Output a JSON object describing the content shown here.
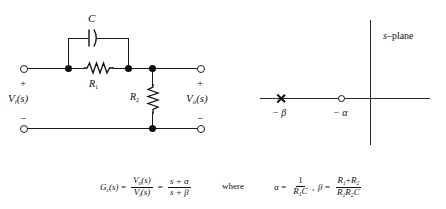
{
  "figure": {
    "circuit": {
      "title_components": {
        "capacitor_label": "C",
        "resistor1_label": "R",
        "resistor1_sub": "1",
        "resistor2_label": "R",
        "resistor2_sub": "2"
      },
      "input_port": {
        "plus": "+",
        "minus": "−",
        "label_main": "V",
        "label_sub": "i",
        "label_arg": "(s)"
      },
      "output_port": {
        "plus": "+",
        "minus": "−",
        "label_main": "V",
        "label_sub": "o",
        "label_arg": "(s)"
      }
    },
    "splane": {
      "title": "s–plane",
      "title_italic_part": "s",
      "title_rest": "–plane",
      "pole_label": "− β",
      "zero_label": "− α",
      "pole_symbol": "x-marker",
      "zero_symbol": "o-marker"
    },
    "equations": {
      "transfer_function": {
        "lhs_main": "G",
        "lhs_sub": "c",
        "lhs_arg": "(s)",
        "eq1": "=",
        "frac1_num_main": "V",
        "frac1_num_sub": "o",
        "frac1_num_arg": "(s)",
        "frac1_den_main": "V",
        "frac1_den_sub": "i",
        "frac1_den_arg": "(s)",
        "eq2": "=",
        "frac2_num": "s + α",
        "frac2_den": "s + β"
      },
      "where_word": "where",
      "alpha_def": {
        "lhs": "α",
        "eq": "=",
        "num": "1",
        "den_main": "R",
        "den_sub": "1",
        "den_tail": "C",
        "comma": ","
      },
      "beta_def": {
        "lhs": "β",
        "eq": "=",
        "num_a": "R",
        "num_a_sub": "1",
        "num_plus": "+",
        "num_b": "R",
        "num_b_sub": "2",
        "den_a": "R",
        "den_a_sub": "1",
        "den_b": "R",
        "den_b_sub": "2",
        "den_c": "C"
      }
    }
  },
  "colors": {
    "ink": "#111111",
    "wire": "#1a1a1a",
    "background": "#ffffff"
  }
}
